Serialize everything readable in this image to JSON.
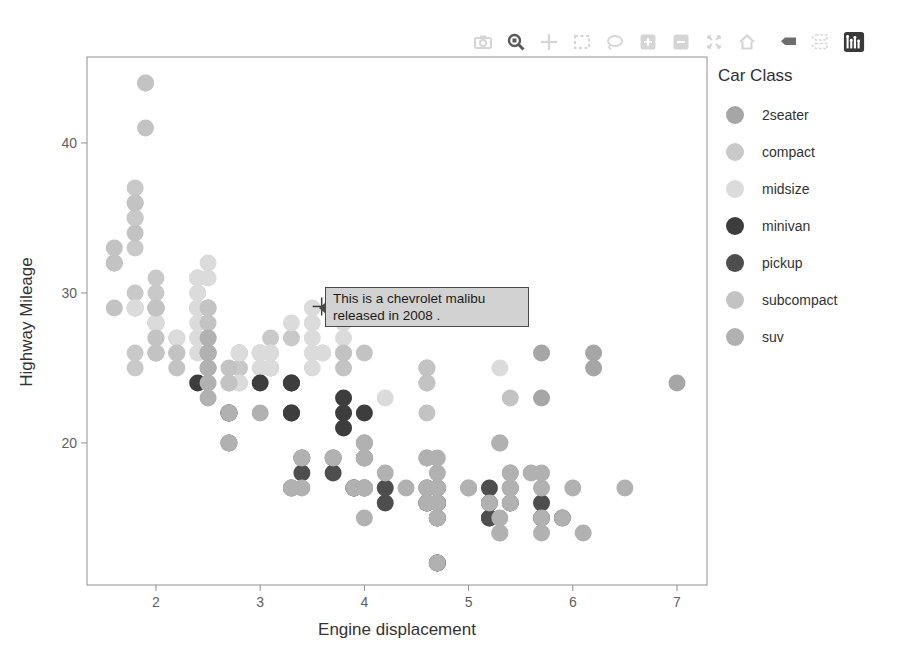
{
  "chart_data": {
    "type": "scatter",
    "title": "",
    "xlabel": "Engine displacement",
    "ylabel": "Highway Mileage",
    "xlim": [
      1.338,
      7.288
    ],
    "ylim": [
      10.53,
      45.73
    ],
    "xticks": [
      2,
      3,
      4,
      5,
      6,
      7
    ],
    "yticks": [
      20,
      30,
      40
    ],
    "grid": false,
    "legend_title": "Car Class",
    "legend_position": "right",
    "series": [
      {
        "name": "2seater",
        "color": "#a6a6a6",
        "points": [
          [
            5.7,
            26
          ],
          [
            5.7,
            23
          ],
          [
            6.2,
            26
          ],
          [
            6.2,
            25
          ],
          [
            7.0,
            24
          ]
        ]
      },
      {
        "name": "compact",
        "color": "#c9c9c9",
        "points": [
          [
            1.8,
            29
          ],
          [
            1.8,
            29
          ],
          [
            2.0,
            31
          ],
          [
            2.0,
            30
          ],
          [
            2.8,
            26
          ],
          [
            2.8,
            26
          ],
          [
            3.1,
            27
          ],
          [
            1.8,
            26
          ],
          [
            1.8,
            25
          ],
          [
            2.0,
            28
          ],
          [
            2.0,
            27
          ],
          [
            2.8,
            25
          ],
          [
            2.8,
            25
          ],
          [
            3.1,
            25
          ],
          [
            3.1,
            25
          ],
          [
            2.2,
            26
          ],
          [
            2.2,
            27
          ],
          [
            2.4,
            29
          ],
          [
            2.4,
            31
          ],
          [
            3.0,
            26
          ],
          [
            3.0,
            26
          ],
          [
            3.3,
            27
          ],
          [
            1.8,
            30
          ],
          [
            1.8,
            33
          ],
          [
            1.8,
            35
          ],
          [
            1.8,
            37
          ],
          [
            1.8,
            35
          ],
          [
            2.0,
            29
          ],
          [
            2.0,
            29
          ],
          [
            2.0,
            28
          ],
          [
            2.0,
            29
          ],
          [
            2.8,
            26
          ],
          [
            1.9,
            44
          ],
          [
            2.0,
            29
          ],
          [
            2.0,
            29
          ],
          [
            2.0,
            28
          ],
          [
            2.0,
            29
          ],
          [
            2.5,
            29
          ],
          [
            2.5,
            29
          ],
          [
            2.8,
            24
          ],
          [
            2.8,
            26
          ],
          [
            2.5,
            26
          ],
          [
            2.5,
            25
          ],
          [
            2.5,
            27
          ],
          [
            2.5,
            26
          ]
        ]
      },
      {
        "name": "midsize",
        "color": "#dbdbdb",
        "points": [
          [
            2.8,
            24
          ],
          [
            3.1,
            25
          ],
          [
            4.2,
            23
          ],
          [
            2.4,
            30
          ],
          [
            2.4,
            29
          ],
          [
            3.1,
            26
          ],
          [
            3.5,
            29
          ],
          [
            3.6,
            26
          ],
          [
            2.4,
            26
          ],
          [
            2.4,
            27
          ],
          [
            2.4,
            30
          ],
          [
            2.4,
            31
          ],
          [
            2.5,
            26
          ],
          [
            2.5,
            27
          ],
          [
            3.3,
            28
          ],
          [
            2.4,
            29
          ],
          [
            2.4,
            27
          ],
          [
            2.5,
            31
          ],
          [
            2.5,
            32
          ],
          [
            3.5,
            27
          ],
          [
            3.5,
            26
          ],
          [
            3.0,
            26
          ],
          [
            3.0,
            25
          ],
          [
            3.5,
            25
          ],
          [
            3.1,
            26
          ],
          [
            3.8,
            27
          ],
          [
            3.8,
            28
          ],
          [
            3.8,
            26
          ],
          [
            5.3,
            25
          ],
          [
            2.2,
            26
          ],
          [
            2.2,
            27
          ],
          [
            2.4,
            28
          ],
          [
            2.4,
            31
          ],
          [
            3.0,
            26
          ],
          [
            3.0,
            26
          ],
          [
            3.5,
            28
          ],
          [
            1.8,
            29
          ],
          [
            1.8,
            29
          ],
          [
            2.0,
            28
          ],
          [
            2.0,
            29
          ],
          [
            2.8,
            26
          ],
          [
            2.8,
            26
          ],
          [
            3.6,
            26
          ]
        ]
      },
      {
        "name": "minivan",
        "color": "#3d3d3d",
        "points": [
          [
            2.4,
            24
          ],
          [
            3.0,
            24
          ],
          [
            3.3,
            22
          ],
          [
            3.3,
            22
          ],
          [
            3.3,
            24
          ],
          [
            3.3,
            24
          ],
          [
            3.3,
            17
          ],
          [
            3.8,
            22
          ],
          [
            3.8,
            21
          ],
          [
            3.8,
            23
          ],
          [
            4.0,
            22
          ]
        ]
      },
      {
        "name": "pickup",
        "color": "#4e4e4e",
        "points": [
          [
            3.7,
            19
          ],
          [
            3.7,
            18
          ],
          [
            3.9,
            17
          ],
          [
            3.9,
            17
          ],
          [
            4.7,
            16
          ],
          [
            4.7,
            16
          ],
          [
            4.7,
            15
          ],
          [
            5.2,
            17
          ],
          [
            5.2,
            15
          ],
          [
            4.7,
            12
          ],
          [
            4.7,
            12
          ],
          [
            4.7,
            16
          ],
          [
            4.7,
            15
          ],
          [
            4.7,
            17
          ],
          [
            5.2,
            15
          ],
          [
            5.2,
            16
          ],
          [
            5.7,
            16
          ],
          [
            5.9,
            15
          ],
          [
            4.2,
            17
          ],
          [
            4.2,
            16
          ],
          [
            4.6,
            16
          ],
          [
            4.6,
            17
          ],
          [
            4.6,
            16
          ],
          [
            5.4,
            16
          ],
          [
            5.4,
            17
          ],
          [
            2.7,
            20
          ],
          [
            2.7,
            22
          ],
          [
            2.7,
            22
          ],
          [
            3.4,
            19
          ],
          [
            3.4,
            18
          ],
          [
            4.0,
            17
          ],
          [
            4.0,
            19
          ],
          [
            4.7,
            17
          ],
          [
            4.7,
            16
          ],
          [
            4.7,
            16
          ],
          [
            5.7,
            15
          ]
        ]
      },
      {
        "name": "subcompact",
        "color": "#c3c3c3",
        "points": [
          [
            1.6,
            33
          ],
          [
            1.6,
            32
          ],
          [
            1.6,
            32
          ],
          [
            1.6,
            29
          ],
          [
            1.6,
            32
          ],
          [
            1.8,
            34
          ],
          [
            1.8,
            36
          ],
          [
            1.8,
            36
          ],
          [
            2.0,
            29
          ],
          [
            2.0,
            26
          ],
          [
            2.0,
            27
          ],
          [
            2.0,
            26
          ],
          [
            2.0,
            26
          ],
          [
            2.7,
            25
          ],
          [
            2.7,
            24
          ],
          [
            2.7,
            24
          ],
          [
            3.8,
            26
          ],
          [
            3.8,
            25
          ],
          [
            4.0,
            26
          ],
          [
            4.6,
            24
          ],
          [
            4.6,
            25
          ],
          [
            4.6,
            25
          ],
          [
            4.6,
            24
          ],
          [
            4.6,
            22
          ],
          [
            5.4,
            23
          ],
          [
            1.9,
            44
          ],
          [
            1.9,
            41
          ],
          [
            2.0,
            29
          ],
          [
            2.0,
            26
          ],
          [
            2.5,
            28
          ],
          [
            2.5,
            29
          ],
          [
            2.2,
            26
          ],
          [
            2.2,
            25
          ],
          [
            2.5,
            25
          ],
          [
            2.5,
            26
          ]
        ]
      },
      {
        "name": "suv",
        "color": "#b1b1b1",
        "points": [
          [
            5.3,
            20
          ],
          [
            5.3,
            15
          ],
          [
            5.3,
            20
          ],
          [
            5.7,
            17
          ],
          [
            6.0,
            17
          ],
          [
            5.3,
            14
          ],
          [
            5.3,
            14
          ],
          [
            5.7,
            15
          ],
          [
            6.5,
            17
          ],
          [
            3.9,
            17
          ],
          [
            4.7,
            16
          ],
          [
            4.7,
            16
          ],
          [
            4.7,
            12
          ],
          [
            4.7,
            17
          ],
          [
            5.2,
            16
          ],
          [
            5.9,
            15
          ],
          [
            4.6,
            17
          ],
          [
            5.4,
            17
          ],
          [
            5.4,
            18
          ],
          [
            4.0,
            17
          ],
          [
            4.0,
            17
          ],
          [
            4.0,
            19
          ],
          [
            4.0,
            17
          ],
          [
            4.6,
            19
          ],
          [
            5.0,
            17
          ],
          [
            3.0,
            22
          ],
          [
            3.7,
            19
          ],
          [
            4.0,
            20
          ],
          [
            4.7,
            15
          ],
          [
            4.7,
            18
          ],
          [
            4.7,
            19
          ],
          [
            5.7,
            14
          ],
          [
            6.1,
            14
          ],
          [
            4.0,
            15
          ],
          [
            4.2,
            18
          ],
          [
            4.4,
            17
          ],
          [
            4.6,
            16
          ],
          [
            5.4,
            17
          ],
          [
            5.4,
            16
          ],
          [
            5.4,
            18
          ],
          [
            4.0,
            17
          ],
          [
            4.0,
            19
          ],
          [
            4.6,
            19
          ],
          [
            5.0,
            17
          ],
          [
            3.3,
            17
          ],
          [
            3.3,
            17
          ],
          [
            4.0,
            20
          ],
          [
            5.6,
            18
          ],
          [
            2.5,
            26
          ],
          [
            2.5,
            24
          ],
          [
            2.5,
            26
          ],
          [
            2.5,
            23
          ],
          [
            2.5,
            25
          ],
          [
            2.5,
            27
          ],
          [
            2.7,
            20
          ],
          [
            2.7,
            22
          ],
          [
            3.4,
            19
          ],
          [
            3.4,
            17
          ],
          [
            4.0,
            20
          ],
          [
            4.7,
            17
          ],
          [
            4.7,
            15
          ],
          [
            5.7,
            18
          ]
        ]
      }
    ]
  },
  "tooltip": {
    "line1": "This is a chevrolet malibu",
    "line2": "released in 2008 .",
    "cursor": {
      "x": 3.59,
      "y": 29.1
    }
  },
  "modebar": {
    "buttons": [
      {
        "name": "download-plot-button",
        "icon": "camera-icon",
        "active": false
      },
      {
        "name": "zoom-button",
        "icon": "magnifier-icon",
        "active": true
      },
      {
        "name": "pan-button",
        "icon": "pan-icon",
        "active": false
      },
      {
        "name": "box-select-button",
        "icon": "box-select-icon",
        "active": false
      },
      {
        "name": "lasso-select-button",
        "icon": "lasso-icon",
        "active": false
      },
      {
        "name": "zoom-in-button",
        "icon": "zoom-in-icon",
        "active": false
      },
      {
        "name": "zoom-out-button",
        "icon": "zoom-out-icon",
        "active": false
      },
      {
        "name": "autoscale-button",
        "icon": "autoscale-icon",
        "active": false
      },
      {
        "name": "reset-axes-button",
        "icon": "home-icon",
        "active": false
      },
      {
        "name": "hover-closest-button",
        "icon": "tag-icon",
        "active": true
      },
      {
        "name": "hover-compare-button",
        "icon": "double-tag-icon",
        "active": false
      },
      {
        "name": "plotly-logo-button",
        "icon": "plotly-logo-icon",
        "active": true
      }
    ]
  },
  "colors": {
    "panel_border": "#8f8f8f",
    "tick": "#8f8f8f",
    "modebar_idle": "#d5d5d5",
    "modebar_active": "#5a5a5a",
    "logo_bg": "#3a3a3a",
    "tooltip_bg": "#d2d2d2",
    "tooltip_border": "#4a4a4a",
    "crosshair": "#3c3c3c"
  }
}
